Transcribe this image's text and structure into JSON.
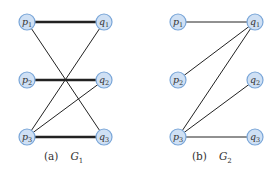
{
  "figures": [
    {
      "id": "G1",
      "caption_tag": "(a)",
      "caption_name": "G",
      "caption_sub": "1",
      "node_radius": 8,
      "nodes": [
        {
          "id": "p1",
          "letter": "p",
          "sub": "1",
          "x": 27,
          "y": 22
        },
        {
          "id": "p2",
          "letter": "p",
          "sub": "2",
          "x": 27,
          "y": 80
        },
        {
          "id": "p3",
          "letter": "p",
          "sub": "3",
          "x": 27,
          "y": 137
        },
        {
          "id": "q1",
          "letter": "q",
          "sub": "1",
          "x": 104,
          "y": 22
        },
        {
          "id": "q2",
          "letter": "q",
          "sub": "2",
          "x": 104,
          "y": 80
        },
        {
          "id": "q3",
          "letter": "q",
          "sub": "3",
          "x": 104,
          "y": 137
        }
      ],
      "edges": [
        {
          "from": "p1",
          "to": "q1",
          "thick": true
        },
        {
          "from": "p1",
          "to": "q3",
          "thick": false
        },
        {
          "from": "p2",
          "to": "q2",
          "thick": true
        },
        {
          "from": "p3",
          "to": "q1",
          "thick": false
        },
        {
          "from": "p3",
          "to": "q2",
          "thick": false
        },
        {
          "from": "p3",
          "to": "q3",
          "thick": true
        }
      ]
    },
    {
      "id": "G2",
      "caption_tag": "(b)",
      "caption_name": "G",
      "caption_sub": "2",
      "node_radius": 8,
      "nodes": [
        {
          "id": "p1",
          "letter": "p",
          "sub": "1",
          "x": 178,
          "y": 22
        },
        {
          "id": "p2",
          "letter": "p",
          "sub": "2",
          "x": 178,
          "y": 80
        },
        {
          "id": "p3",
          "letter": "p",
          "sub": "3",
          "x": 178,
          "y": 137
        },
        {
          "id": "q1",
          "letter": "q",
          "sub": "1",
          "x": 255,
          "y": 22
        },
        {
          "id": "q2",
          "letter": "q",
          "sub": "2",
          "x": 255,
          "y": 80
        },
        {
          "id": "q3",
          "letter": "q",
          "sub": "3",
          "x": 255,
          "y": 137
        }
      ],
      "edges": [
        {
          "from": "p1",
          "to": "q1",
          "thick": false
        },
        {
          "from": "p2",
          "to": "q1",
          "thick": false
        },
        {
          "from": "p3",
          "to": "q1",
          "thick": false
        },
        {
          "from": "p3",
          "to": "q2",
          "thick": false
        },
        {
          "from": "p3",
          "to": "q3",
          "thick": false
        }
      ]
    }
  ],
  "colors": {
    "node_fill": "#cfe0f4",
    "node_stroke": "#7aa6d8",
    "edge": "#222222",
    "text": "#333333"
  }
}
